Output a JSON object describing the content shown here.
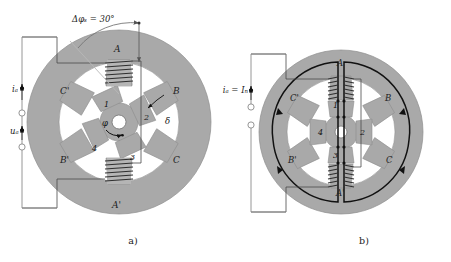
{
  "figure": {
    "type": "switched-reluctance-motor-cross-section",
    "subfigures": [
      {
        "id": "a",
        "caption": "a)",
        "description": "stator-rotor geometry with phase A excitation"
      },
      {
        "id": "b",
        "caption": "b)",
        "description": "magnetic flux paths at rated phase current"
      }
    ]
  },
  "panel_a": {
    "angle_annotation": "Δφₛ = 30°",
    "current_label": "iₐ",
    "voltage_label": "uₐ",
    "rotor_angle_label": "φ",
    "airgap_label": "δ",
    "stator_poles": [
      {
        "label": "A",
        "angle_deg": 90
      },
      {
        "label": "B",
        "angle_deg": 30
      },
      {
        "label": "C",
        "angle_deg": -30
      },
      {
        "label": "A'",
        "angle_deg": -90
      },
      {
        "label": "B'",
        "angle_deg": -150
      },
      {
        "label": "C'",
        "angle_deg": 150
      }
    ],
    "rotor_poles": [
      {
        "label": "1",
        "angle_deg": 115
      },
      {
        "label": "2",
        "angle_deg": 25
      },
      {
        "label": "3",
        "angle_deg": -65
      },
      {
        "label": "4",
        "angle_deg": -155
      }
    ],
    "coil_turns": 6
  },
  "panel_b": {
    "current_label": "iₐ = Iₙ",
    "stator_poles": [
      {
        "label": "A",
        "angle_deg": 90
      },
      {
        "label": "B",
        "angle_deg": 30
      },
      {
        "label": "C",
        "angle_deg": -30
      },
      {
        "label": "A'",
        "angle_deg": -90
      },
      {
        "label": "B'",
        "angle_deg": -150
      },
      {
        "label": "C'",
        "angle_deg": 150
      }
    ],
    "rotor_poles": [
      {
        "label": "1",
        "angle_deg": 90
      },
      {
        "label": "2",
        "angle_deg": 0
      },
      {
        "label": "3",
        "angle_deg": -90
      },
      {
        "label": "4",
        "angle_deg": 180
      }
    ],
    "coil_turns": 6,
    "flux_paths": 2
  },
  "colors": {
    "iron": "#a9a9a9",
    "iron_edge": "#8f8f8f",
    "background": "#ffffff",
    "line": "#111111",
    "circuit": "#8a8a8a",
    "coil": "#3a3a3a"
  }
}
